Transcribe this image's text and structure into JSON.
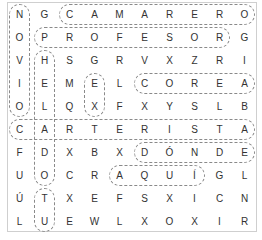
{
  "puzzle": {
    "title": "Word search",
    "rows": 10,
    "cols": 10,
    "grid": [
      [
        "N",
        "G",
        "C",
        "A",
        "M",
        "A",
        "R",
        "E",
        "R",
        "O"
      ],
      [
        "O",
        "P",
        "R",
        "O",
        "F",
        "E",
        "S",
        "O",
        "R",
        "G"
      ],
      [
        "V",
        "H",
        "S",
        "G",
        "R",
        "V",
        "X",
        "Z",
        "R",
        "I"
      ],
      [
        "I",
        "E",
        "M",
        "E",
        "L",
        "C",
        "O",
        "R",
        "E",
        "A"
      ],
      [
        "O",
        "L",
        "Q",
        "X",
        "F",
        "X",
        "Y",
        "S",
        "L",
        "B"
      ],
      [
        "C",
        "A",
        "R",
        "T",
        "E",
        "R",
        "I",
        "S",
        "T",
        "A"
      ],
      [
        "F",
        "D",
        "X",
        "B",
        "X",
        "D",
        "Ó",
        "N",
        "D",
        "E"
      ],
      [
        "U",
        "O",
        "C",
        "R",
        "A",
        "Q",
        "U",
        "Í",
        "G",
        "L"
      ],
      [
        "Ú",
        "T",
        "X",
        "E",
        "F",
        "S",
        "X",
        "I",
        "C",
        "N"
      ],
      [
        "L",
        "U",
        "E",
        "W",
        "L",
        "X",
        "O",
        "X",
        "I",
        "R"
      ]
    ],
    "found_words": [
      {
        "word": "CAMARERO",
        "start": [
          0,
          2
        ],
        "end": [
          0,
          9
        ],
        "dir": "h"
      },
      {
        "word": "PROFESOR",
        "start": [
          1,
          1
        ],
        "end": [
          1,
          8
        ],
        "dir": "h"
      },
      {
        "word": "COREA",
        "start": [
          3,
          5
        ],
        "end": [
          3,
          9
        ],
        "dir": "h"
      },
      {
        "word": "CARTERISTA",
        "start": [
          5,
          0
        ],
        "end": [
          5,
          9
        ],
        "dir": "h"
      },
      {
        "word": "DÓNDE",
        "start": [
          6,
          5
        ],
        "end": [
          6,
          9
        ],
        "dir": "h"
      },
      {
        "word": "AQUÍ",
        "start": [
          7,
          4
        ],
        "end": [
          7,
          7
        ],
        "dir": "h"
      },
      {
        "word": "NOVIO",
        "start": [
          0,
          0
        ],
        "end": [
          4,
          0
        ],
        "dir": "v"
      },
      {
        "word": "HELADO",
        "start": [
          2,
          1
        ],
        "end": [
          7,
          1
        ],
        "dir": "v"
      },
      {
        "word": "EX",
        "start": [
          3,
          3
        ],
        "end": [
          4,
          3
        ],
        "dir": "v"
      },
      {
        "word": "TU",
        "start": [
          8,
          1
        ],
        "end": [
          9,
          1
        ],
        "dir": "v"
      }
    ],
    "colors": {
      "border": "#cfcfcf",
      "highlight": "#8a8a8a",
      "letter": "#333333"
    }
  }
}
